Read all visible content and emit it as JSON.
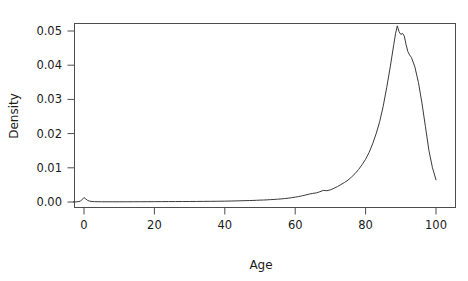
{
  "chart_data": {
    "type": "line",
    "title": "",
    "subtitle": "",
    "xlabel": "Age",
    "ylabel": "Density",
    "xlim": [
      -3,
      103
    ],
    "ylim": [
      -0.0016,
      0.0545
    ],
    "grid": false,
    "legend": null,
    "xticks": [
      0,
      20,
      40,
      60,
      80,
      100
    ],
    "xtick_labels": [
      "0",
      "20",
      "40",
      "60",
      "80",
      "100"
    ],
    "yticks": [
      0.0,
      0.01,
      0.02,
      0.03,
      0.04,
      0.05
    ],
    "ytick_labels": [
      "0.00",
      "0.01",
      "0.02",
      "0.03",
      "0.04",
      "0.05"
    ],
    "series": [
      {
        "name": "Density",
        "color": "#3a3a3a",
        "x": [
          -3,
          -2,
          -1,
          0,
          0.5,
          1,
          1.5,
          2,
          3,
          4,
          5,
          6,
          8,
          10,
          12,
          14,
          16,
          18,
          20,
          22,
          24,
          26,
          28,
          30,
          32,
          34,
          36,
          38,
          40,
          42,
          44,
          46,
          47,
          48,
          49,
          50,
          51,
          52,
          53,
          54,
          55,
          56,
          57,
          58,
          59,
          60,
          61,
          62,
          63,
          64,
          65,
          66,
          67,
          68,
          69,
          70,
          71,
          72,
          73,
          74,
          75,
          76,
          77,
          78,
          79,
          80,
          81,
          82,
          83,
          84,
          85,
          86,
          87,
          88,
          88.5,
          89,
          89.5,
          90,
          90.5,
          91,
          91.5,
          92,
          92.5,
          93,
          94,
          95,
          96,
          97,
          98,
          99,
          100
        ],
        "y": [
          2e-05,
          4e-05,
          0.00025,
          0.0013,
          0.0009,
          0.00048,
          0.00028,
          0.00018,
          0.0001,
          8e-05,
          7e-05,
          6e-05,
          6e-05,
          6e-05,
          6e-05,
          7e-05,
          8e-05,
          9e-05,
          0.0001,
          0.00011,
          0.00012,
          0.00013,
          0.00014,
          0.00015,
          0.00016,
          0.00018,
          0.0002,
          0.00022,
          0.00025,
          0.00029,
          0.00034,
          0.0004,
          0.00043,
          0.00046,
          0.0005,
          0.00055,
          0.00058,
          0.00063,
          0.0007,
          0.00075,
          0.00082,
          0.0009,
          0.001,
          0.00112,
          0.00126,
          0.00142,
          0.0016,
          0.00181,
          0.00205,
          0.00232,
          0.00252,
          0.00266,
          0.003,
          0.0034,
          0.0033,
          0.00355,
          0.004,
          0.0045,
          0.0051,
          0.0057,
          0.0064,
          0.0073,
          0.0083,
          0.0095,
          0.0109,
          0.0125,
          0.0145,
          0.017,
          0.02,
          0.0235,
          0.028,
          0.0335,
          0.0395,
          0.046,
          0.0492,
          0.0515,
          0.0498,
          0.049,
          0.0493,
          0.0485,
          0.046,
          0.044,
          0.043,
          0.0423,
          0.0395,
          0.035,
          0.029,
          0.022,
          0.015,
          0.01,
          0.0065
        ],
        "peak": {
          "x": 89,
          "y": 0.0515
        },
        "endpoint": {
          "x": 100,
          "y": 0.0065
        },
        "infant_spike": {
          "x": 0,
          "y": 0.0013
        }
      }
    ]
  },
  "labels": {
    "x_axis_title": "Age",
    "y_axis_title": "Density"
  }
}
